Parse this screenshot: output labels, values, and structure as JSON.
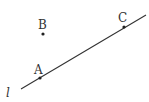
{
  "diagram": {
    "line": {
      "label": "l",
      "x1": 21,
      "y1": 89,
      "x2": 146,
      "y2": 15
    },
    "points": [
      {
        "label": "A",
        "x": 40,
        "y": 78,
        "lx": 35,
        "ly": 74
      },
      {
        "label": "B",
        "x": 43,
        "y": 34,
        "lx": 38,
        "ly": 29
      },
      {
        "label": "C",
        "x": 124,
        "y": 27,
        "lx": 118,
        "ly": 22
      }
    ]
  }
}
